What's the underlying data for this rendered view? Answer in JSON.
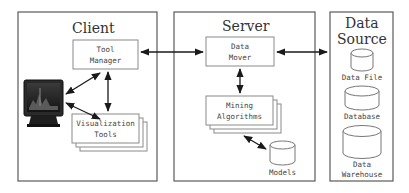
{
  "tiers": {
    "client": {
      "title": "Client"
    },
    "server": {
      "title": "Server"
    },
    "data_source": {
      "title_line1": "Data",
      "title_line2": "Source"
    }
  },
  "client": {
    "tool_manager": {
      "line1": "Tool",
      "line2": "Manager"
    },
    "visualization_tools": {
      "line1": "Visualization",
      "line2": "Tools"
    },
    "monitor_icon": "computer-monitor"
  },
  "server": {
    "data_mover": {
      "line1": "Data",
      "line2": "Mover"
    },
    "mining_algorithms": {
      "line1": "Mining",
      "line2": "Algorithms"
    },
    "models": {
      "label": "Models"
    }
  },
  "data_source": {
    "stores": [
      {
        "label_line1": "Data File",
        "label_line2": ""
      },
      {
        "label_line1": "Database",
        "label_line2": ""
      },
      {
        "label_line1": "Data",
        "label_line2": "Warehouse"
      }
    ]
  },
  "connections": [
    {
      "from": "Monitor",
      "to": "Tool Manager",
      "direction": "bidirectional"
    },
    {
      "from": "Monitor",
      "to": "Visualization Tools",
      "direction": "bidirectional"
    },
    {
      "from": "Tool Manager",
      "to": "Visualization Tools",
      "direction": "bidirectional"
    },
    {
      "from": "Tool Manager",
      "to": "Data Mover",
      "direction": "bidirectional"
    },
    {
      "from": "Data Mover",
      "to": "Data Source",
      "direction": "bidirectional"
    },
    {
      "from": "Data Mover",
      "to": "Mining Algorithms",
      "direction": "bidirectional"
    },
    {
      "from": "Mining Algorithms",
      "to": "Models",
      "direction": "bidirectional"
    }
  ]
}
